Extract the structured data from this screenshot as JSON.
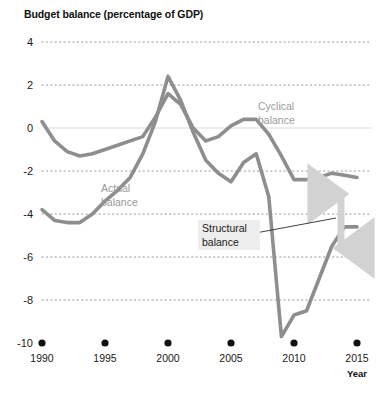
{
  "chart_data": {
    "type": "line",
    "title": "Budget balance (percentage of GDP)",
    "xlabel": "Year",
    "ylabel": "",
    "xlim": [
      1990,
      2015
    ],
    "ylim": [
      -10,
      4
    ],
    "grid": true,
    "grid_style": "dotted-horizontal",
    "legend": "inline-annotations",
    "xticks": [
      "1990",
      "1995",
      "2000",
      "2005",
      "2010",
      "2015"
    ],
    "xtick_values": [
      1990,
      1995,
      2000,
      2005,
      2010,
      2015
    ],
    "yticks": [
      "4",
      "2",
      "0",
      "-2",
      "-4",
      "-6",
      "-8",
      "-10"
    ],
    "ytick_values": [
      4,
      2,
      0,
      -2,
      -4,
      -6,
      -8,
      -10
    ],
    "x": [
      1990,
      1991,
      1992,
      1993,
      1994,
      1995,
      1996,
      1997,
      1998,
      1999,
      2000,
      2001,
      2002,
      2003,
      2004,
      2005,
      2006,
      2007,
      2008,
      2009,
      2010,
      2011,
      2012,
      2013,
      2014,
      2015
    ],
    "series": [
      {
        "name": "Cyclical balance",
        "color": "#8e8e8e",
        "values": [
          0.3,
          -0.6,
          -1.1,
          -1.3,
          -1.2,
          -1.0,
          -0.8,
          -0.6,
          -0.4,
          0.5,
          1.6,
          1.1,
          0.0,
          -0.6,
          -0.4,
          0.1,
          0.4,
          0.4,
          -0.3,
          -1.3,
          -2.4,
          -2.4,
          -2.3,
          -2.1,
          -2.2,
          -2.3
        ]
      },
      {
        "name": "Actual balance",
        "color": "#8e8e8e",
        "values": [
          -3.8,
          -4.3,
          -4.4,
          -4.4,
          -4.0,
          -3.4,
          -2.9,
          -2.3,
          -1.2,
          0.3,
          2.4,
          1.3,
          -0.2,
          -1.5,
          -2.1,
          -2.5,
          -1.6,
          -1.2,
          -3.2,
          -9.7,
          -8.7,
          -8.5,
          -7.0,
          -5.5,
          -4.6,
          -4.6
        ]
      }
    ],
    "annotations": [
      {
        "name": "cyclical-balance-label",
        "text_line1": "Cyclical",
        "text_line2": "balance"
      },
      {
        "name": "actual-balance-label",
        "text_line1": "Actual",
        "text_line2": "balance"
      },
      {
        "name": "structural-balance-callout",
        "text_line1": "Structural",
        "text_line2": "balance"
      },
      {
        "name": "gap-arrow",
        "text": "",
        "description": "double-headed vertical arrow"
      }
    ]
  }
}
